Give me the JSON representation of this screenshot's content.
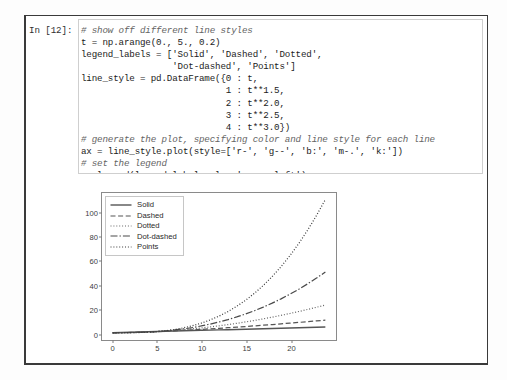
{
  "notebook": {
    "prompt_label": "In [12]:",
    "code_lines": [
      {
        "text": "# show off different line styles",
        "comment": true
      },
      {
        "text": "t = np.arange(0., 5., 0.2)",
        "comment": false
      },
      {
        "text": "legend_labels = ['Solid', 'Dashed', 'Dotted',",
        "comment": false
      },
      {
        "text": "                 'Dot-dashed', 'Points']",
        "comment": false
      },
      {
        "text": "line_style = pd.DataFrame({0 : t,",
        "comment": false
      },
      {
        "text": "                           1 : t**1.5,",
        "comment": false
      },
      {
        "text": "                           2 : t**2.0,",
        "comment": false
      },
      {
        "text": "                           3 : t**2.5,",
        "comment": false
      },
      {
        "text": "                           4 : t**3.0})",
        "comment": false
      },
      {
        "text": "# generate the plot, specifying color and line style for each line",
        "comment": true
      },
      {
        "text": "ax = line_style.plot(style=['r-', 'g--', 'b:', 'm-.', 'k:'])",
        "comment": false
      },
      {
        "text": "# set the legend",
        "comment": true
      },
      {
        "text": "ax.legend(legend_labels, loc='upper left');",
        "comment": false
      }
    ]
  },
  "chart_data": {
    "type": "line",
    "title": "",
    "xlabel": "",
    "ylabel": "",
    "xlim": [
      -1.2,
      25.2
    ],
    "ylim": [
      -6,
      116
    ],
    "xticks": [
      0,
      5,
      10,
      15,
      20
    ],
    "yticks": [
      0,
      20,
      40,
      60,
      80,
      100
    ],
    "grid": false,
    "legend_position": "upper left",
    "x": [
      0,
      1,
      2,
      3,
      4,
      5,
      6,
      7,
      8,
      9,
      10,
      11,
      12,
      13,
      14,
      15,
      16,
      17,
      18,
      19,
      20,
      21,
      22,
      23,
      24
    ],
    "series": [
      {
        "name": "Solid",
        "style": "r-",
        "linestyle": "solid",
        "color": "#555555",
        "values": [
          0,
          0.2,
          0.4,
          0.6,
          0.8,
          1.0,
          1.2,
          1.4,
          1.6,
          1.8,
          2.0,
          2.2,
          2.4,
          2.6,
          2.8,
          3.0,
          3.2,
          3.4,
          3.6,
          3.8,
          4.0,
          4.2,
          4.4,
          4.6,
          4.8
        ]
      },
      {
        "name": "Dashed",
        "style": "g--",
        "linestyle": "dashed",
        "color": "#555555",
        "values": [
          0,
          0.089,
          0.253,
          0.465,
          0.716,
          1.0,
          1.315,
          1.657,
          2.024,
          2.415,
          2.828,
          3.263,
          3.718,
          4.193,
          4.687,
          5.196,
          5.724,
          6.268,
          6.828,
          7.404,
          7.995,
          8.6,
          9.22,
          9.854,
          10.5
        ]
      },
      {
        "name": "Dotted",
        "style": "b:",
        "linestyle": "dotted",
        "color": "#666666",
        "values": [
          0,
          0.04,
          0.16,
          0.36,
          0.64,
          1.0,
          1.44,
          1.96,
          2.56,
          3.24,
          4.0,
          4.84,
          5.76,
          6.76,
          7.84,
          9.0,
          10.24,
          11.56,
          12.96,
          14.44,
          16.0,
          17.64,
          19.36,
          21.16,
          23.04
        ]
      },
      {
        "name": "Dot-dashed",
        "style": "m-.",
        "linestyle": "dashdot",
        "color": "#4a4a4a",
        "values": [
          0,
          0.018,
          0.101,
          0.279,
          0.572,
          1.0,
          1.577,
          2.315,
          3.226,
          4.32,
          5.657,
          7.178,
          8.916,
          10.903,
          13.123,
          15.588,
          18.313,
          21.312,
          24.588,
          28.162,
          32.0,
          36.15,
          40.61,
          45.38,
          50.4
        ]
      },
      {
        "name": "Points",
        "style": "k:",
        "linestyle": "dotted",
        "color": "#3a3a3a",
        "values": [
          0,
          0.008,
          0.064,
          0.216,
          0.512,
          1.0,
          1.728,
          2.744,
          4.096,
          5.832,
          8.0,
          10.648,
          13.824,
          17.576,
          21.952,
          27.0,
          32.768,
          39.304,
          46.656,
          54.872,
          64.0,
          74.09,
          85.18,
          97.34,
          110.6
        ]
      }
    ]
  }
}
